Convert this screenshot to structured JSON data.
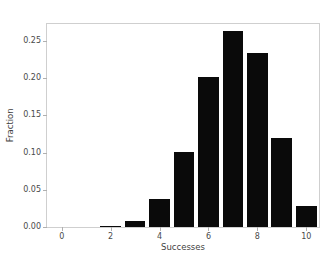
{
  "chart_data": {
    "type": "bar",
    "title": "",
    "xlabel": "Successes",
    "ylabel": "Fraction",
    "categories": [
      0,
      1,
      2,
      3,
      4,
      5,
      6,
      7,
      8,
      9,
      10
    ],
    "values": [
      0.0,
      0.0,
      0.001,
      0.008,
      0.037,
      0.101,
      0.202,
      0.263,
      0.234,
      0.119,
      0.028
    ],
    "xlim": [
      -0.6,
      10.6
    ],
    "ylim": [
      0.0,
      0.2755
    ],
    "xticks": [
      0,
      2,
      4,
      6,
      8,
      10
    ],
    "xticklabels": [
      "0",
      "2",
      "4",
      "6",
      "8",
      "10"
    ],
    "yticks": [
      0.0,
      0.05,
      0.1,
      0.15,
      0.2,
      0.25
    ],
    "yticklabels": [
      "0.00",
      "0.05",
      "0.10",
      "0.15",
      "0.20",
      "0.25"
    ],
    "grid": false,
    "legend": null,
    "bar_color": "#0a0a0a",
    "bar_width": 0.85,
    "background": "#ffffff",
    "spine_color": "#cfcfcf",
    "tick_color": "#4a4a4a"
  }
}
